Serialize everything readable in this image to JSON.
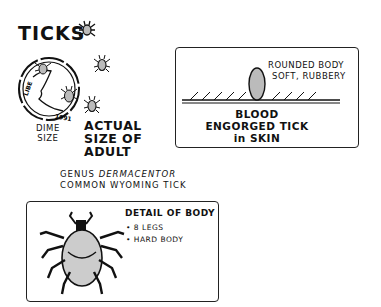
{
  "title": "TICKS",
  "dime": {
    "coin_inscription": "LIBERTY",
    "coin_year": "1991",
    "label_line1": "DIME",
    "label_line2": "SIZE"
  },
  "actual_size": {
    "line1": "ACTUAL",
    "line2": "SIZE OF",
    "line3": "ADULT"
  },
  "genus": {
    "prefix": "GENUS",
    "name": "DERMACENTOR",
    "line2": "COMMON WYOMING TICK"
  },
  "engorged_panel": {
    "annotation_line1": "ROUNDED BODY",
    "annotation_line2": "SOFT, RUBBERY",
    "caption_line1": "BLOOD",
    "caption_line2": "ENGORGED TICK",
    "caption_line3": "in SKIN"
  },
  "detail_panel": {
    "heading": "DETAIL OF BODY",
    "bullets": [
      "8 LEGS",
      "HARD BODY"
    ]
  }
}
